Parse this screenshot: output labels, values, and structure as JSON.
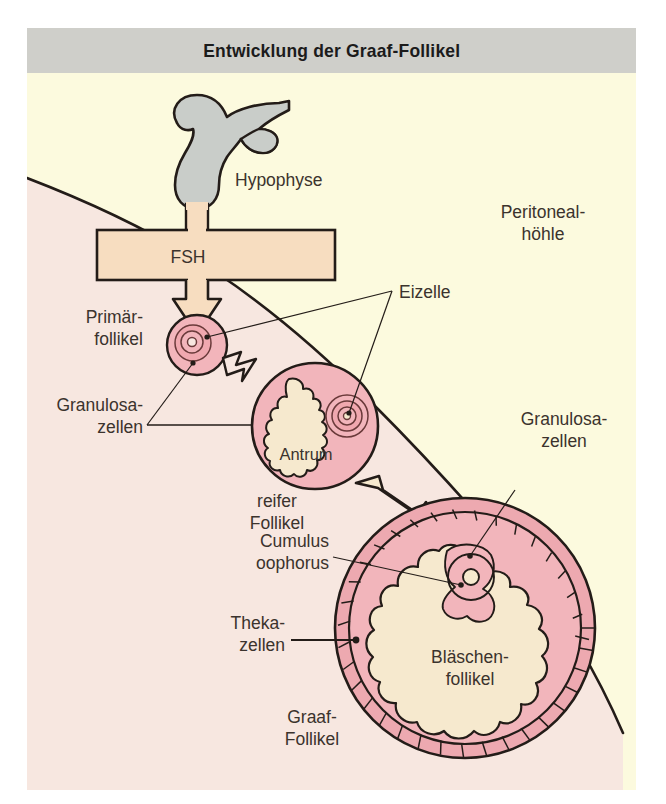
{
  "figure": {
    "title": "Entwicklung der Graaf-Follikel",
    "title_bar_color": "#cfcfca",
    "background_cream": "#fcfade",
    "background_ovary": "#f7e7e0",
    "follicle_pink": "#f2b5bb",
    "antrum_cream": "#f6e9ce",
    "fsh_box_fill": "#f7ddc0",
    "pituitary_gray": "#c9cdc9",
    "outline_color": "#231c18",
    "label_color": "#3b332d"
  },
  "labels": {
    "hypophyse": "Hypophyse",
    "fsh": "FSH",
    "peritoneal_line1": "Peritoneal-",
    "peritoneal_line2": "höhle",
    "primaer_line1": "Primär-",
    "primaer_line2": "follikel",
    "granulosa_left_line1": "Granulosa-",
    "granulosa_left_line2": "zellen",
    "granulosa_right_line1": "Granulosa-",
    "granulosa_right_line2": "zellen",
    "eizelle": "Eizelle",
    "antrum": "Antrum",
    "reifer_line1": "reifer",
    "reifer_line2": "Follikel",
    "cumulus_line1": "Cumulus",
    "cumulus_line2": "oophorus",
    "theka_line1": "Theka-",
    "theka_line2": "zellen",
    "blaeschen_line1": "Bläschen-",
    "blaeschen_line2": "follikel",
    "graaf_line1": "Graaf-",
    "graaf_line2": "Follikel"
  },
  "structures": {
    "pituitary": "Hypophyse gland, gray lobed organic shape at top",
    "fsh_arrow": "Block arrow labelled FSH pointing downward toward primary follicle",
    "primary_follicle": "Small pink circle with concentric rings representing oocyte",
    "mature_follicle": "Medium pink circle containing irregular cream antrum cavity and oocyte rings",
    "graaf_follicle": "Large follicle with outer brick-patterned theka cell ring, pink granulosa layer, and large cream antrum with cumulus oophorus and oocyte",
    "ovary_boundary": "Curved line separating ovary tissue from peritoneal cavity"
  }
}
